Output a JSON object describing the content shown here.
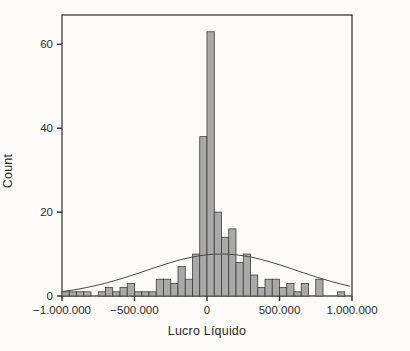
{
  "chart_data": {
    "type": "histogram",
    "title": "",
    "xlabel": "Lucro Líquido",
    "ylabel": "Count",
    "xlim": [
      -1000000,
      1000000
    ],
    "ylim": [
      0,
      67
    ],
    "bin_start": -1000000,
    "bin_width": 50000,
    "counts": [
      1,
      1,
      1,
      1,
      0,
      1,
      2,
      1,
      2,
      3,
      1,
      1,
      1,
      4,
      4,
      3,
      7,
      4,
      10,
      38,
      63,
      20,
      14,
      16,
      8,
      10,
      5,
      2,
      4,
      4,
      2,
      3,
      1,
      3,
      0,
      4,
      0,
      0,
      1,
      0
    ],
    "x_ticks": {
      "values": [
        -1000000,
        -500000,
        0,
        500000,
        1000000
      ],
      "labels": [
        "−1.000.000",
        "−500.000",
        "0",
        "500.000",
        "1.000.000"
      ]
    },
    "y_ticks": {
      "values": [
        0,
        20,
        40,
        60
      ],
      "labels": [
        "0",
        "20",
        "40",
        "60"
      ]
    },
    "normal_curve": {
      "mean": 100000,
      "sd": 520000,
      "peak": 10
    },
    "grid": "off",
    "legend": "none",
    "colors": {
      "background": "#fcfbf8",
      "bar_fill": "#a9a9a9",
      "bar_border": "#3d3d3d",
      "frame": "#2b2b2b",
      "curve": "#4a4a4a",
      "text": "#2b2b2b"
    }
  }
}
